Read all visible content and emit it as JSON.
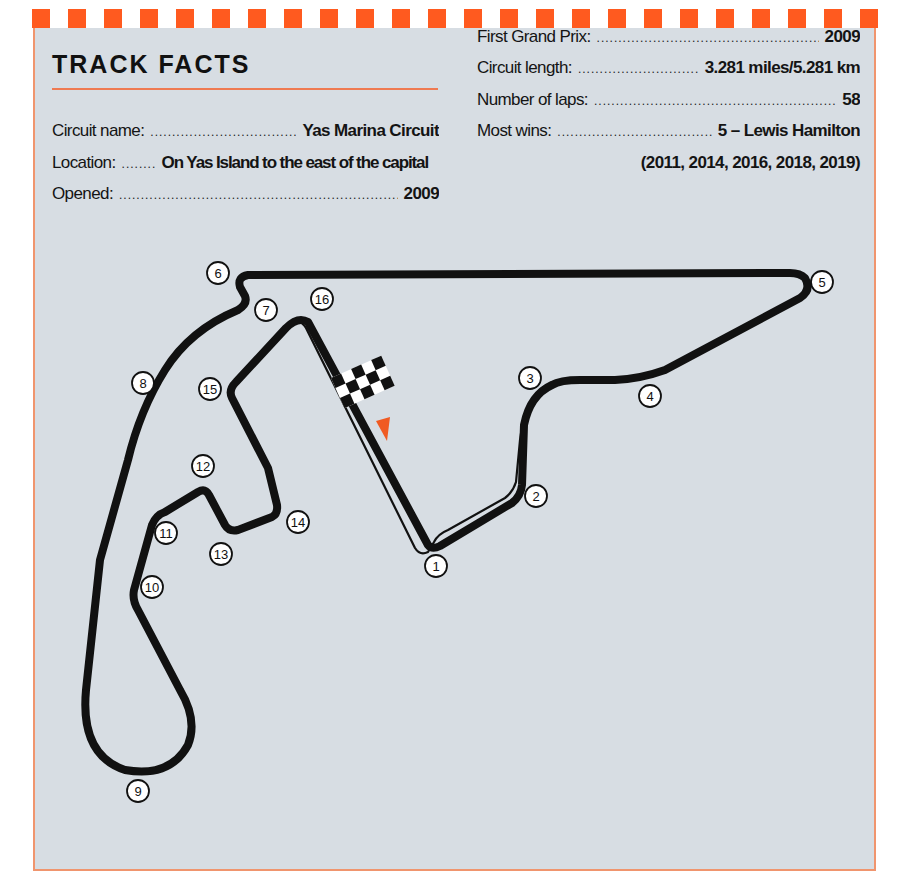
{
  "header": {
    "title": "TRACK FACTS"
  },
  "facts_left": [
    {
      "label": "Circuit name:",
      "value": "Yas Marina Circuit"
    },
    {
      "label": "Location:",
      "value": "On Yas Island to the east of the capital"
    },
    {
      "label": "Opened:",
      "value": "2009"
    }
  ],
  "facts_right": [
    {
      "label": "First Grand Prix:",
      "value": "2009"
    },
    {
      "label": "Circuit length:",
      "value": "3.281 miles/5.281 km"
    },
    {
      "label": "Number of laps:",
      "value": "58"
    },
    {
      "label": "Most wins:",
      "value": "5 – Lewis Hamilton"
    }
  ],
  "most_wins_years": "(2011, 2014, 2016, 2018, 2019)",
  "colors": {
    "accent": "#ff5a1f",
    "panel_bg": "#d7dde3",
    "track": "#111111",
    "start_arrow": "#f05a22"
  },
  "map": {
    "start_finish_icon": "checkered-flag-icon",
    "direction_icon": "orange-triangle-arrow-icon",
    "turns": [
      {
        "n": "1",
        "x": 436,
        "y": 566
      },
      {
        "n": "2",
        "x": 536,
        "y": 496
      },
      {
        "n": "3",
        "x": 530,
        "y": 378
      },
      {
        "n": "4",
        "x": 650,
        "y": 396
      },
      {
        "n": "5",
        "x": 822,
        "y": 282
      },
      {
        "n": "6",
        "x": 218,
        "y": 273
      },
      {
        "n": "7",
        "x": 266,
        "y": 310
      },
      {
        "n": "8",
        "x": 143,
        "y": 383
      },
      {
        "n": "9",
        "x": 138,
        "y": 791
      },
      {
        "n": "10",
        "x": 152,
        "y": 587
      },
      {
        "n": "11",
        "x": 166,
        "y": 533
      },
      {
        "n": "12",
        "x": 203,
        "y": 466
      },
      {
        "n": "13",
        "x": 221,
        "y": 554
      },
      {
        "n": "14",
        "x": 298,
        "y": 522
      },
      {
        "n": "15",
        "x": 210,
        "y": 389
      },
      {
        "n": "16",
        "x": 322,
        "y": 299
      }
    ]
  }
}
